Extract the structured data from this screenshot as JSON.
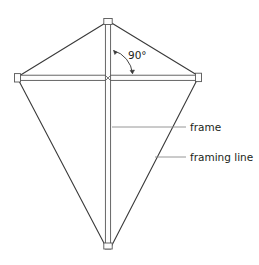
{
  "figure": {
    "background_color": "#ffffff",
    "line_color": "#3a3a3a",
    "spar_fill": "#fdfdfd",
    "spar_stroke": "#555555",
    "leader_color": "#8a8a8a",
    "text_color": "#231f20"
  },
  "annotations": {
    "angle": {
      "value": "90°",
      "x": 128,
      "y": 59
    },
    "labels": [
      {
        "id": "frame",
        "text": "frame",
        "x": 189,
        "y": 131
      },
      {
        "id": "framing-line",
        "text": "framing line",
        "x": 189,
        "y": 161
      }
    ]
  },
  "geometry": {
    "top": {
      "x": 108,
      "y": 21
    },
    "bottom": {
      "x": 108,
      "y": 248
    },
    "left": {
      "x": 18,
      "y": 78
    },
    "right": {
      "x": 198,
      "y": 77
    },
    "cross": {
      "x": 108,
      "y": 78
    },
    "spar_half_width": 2.6
  }
}
